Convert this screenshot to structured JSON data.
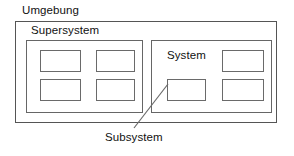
{
  "diagram": {
    "title_label": "Umgebung",
    "labels": {
      "environment": "Umgebung",
      "supersystem": "Supersystem",
      "system": "System",
      "subsystem": "Subsystem"
    },
    "colors": {
      "background": "#ffffff",
      "line": "#555555",
      "inner_line": "#666666",
      "unit_line": "#6a6a6a",
      "text": "#111111"
    },
    "containers": [
      {
        "name": "environment",
        "label": "Umgebung",
        "label_position": "outside-top-left",
        "x": 15,
        "y": 21,
        "width": 262,
        "height": 102
      },
      {
        "name": "supersystem",
        "label": "Supersystem",
        "label_position": "inside-outer-top-left",
        "x": 26,
        "y": 40,
        "width": 117,
        "height": 73
      },
      {
        "name": "system",
        "label": "System",
        "label_position": "inside-top-left",
        "x": 151,
        "y": 40,
        "width": 121,
        "height": 73
      }
    ],
    "units": [
      {
        "parent": "supersystem",
        "row": 1,
        "col": 1,
        "x": 40,
        "y": 50,
        "width": 41,
        "height": 22
      },
      {
        "parent": "supersystem",
        "row": 1,
        "col": 2,
        "x": 96,
        "y": 50,
        "width": 39,
        "height": 22
      },
      {
        "parent": "supersystem",
        "row": 2,
        "col": 1,
        "x": 40,
        "y": 79,
        "width": 41,
        "height": 22
      },
      {
        "parent": "supersystem",
        "row": 2,
        "col": 2,
        "x": 96,
        "y": 79,
        "width": 39,
        "height": 22
      },
      {
        "parent": "system",
        "row": 1,
        "col": 2,
        "x": 222,
        "y": 50,
        "width": 42,
        "height": 22
      },
      {
        "parent": "system",
        "row": 2,
        "col": 1,
        "x": 167,
        "y": 79,
        "width": 39,
        "height": 22,
        "callout": "subsystem"
      },
      {
        "parent": "system",
        "row": 2,
        "col": 2,
        "x": 222,
        "y": 79,
        "width": 42,
        "height": 22
      }
    ],
    "callout": {
      "label": "Subsystem",
      "target_unit": "system-unit-r2c1",
      "line": {
        "x1": 134,
        "y1": 128,
        "x2": 168,
        "y2": 84
      }
    }
  }
}
